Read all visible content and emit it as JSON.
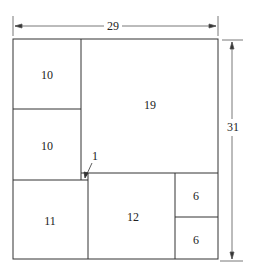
{
  "diagram": {
    "width_label": "29",
    "height_label": "31",
    "squares": [
      {
        "label": "10",
        "x": 13,
        "y": 39,
        "w": 68,
        "h": 70
      },
      {
        "label": "10",
        "x": 13,
        "y": 109,
        "w": 68,
        "h": 71
      },
      {
        "label": "19",
        "x": 81,
        "y": 39,
        "w": 137,
        "h": 134
      },
      {
        "label": "1",
        "x": 81,
        "y": 173,
        "w": 7,
        "h": 7
      },
      {
        "label": "11",
        "x": 13,
        "y": 180,
        "w": 75,
        "h": 79
      },
      {
        "label": "12",
        "x": 88,
        "y": 173,
        "w": 87,
        "h": 86
      },
      {
        "label": "6",
        "x": 175,
        "y": 173,
        "w": 43,
        "h": 44
      },
      {
        "label": "6",
        "x": 175,
        "y": 217,
        "w": 43,
        "h": 42
      }
    ],
    "colors": {
      "line": "#333333",
      "dim": "#555555"
    }
  }
}
